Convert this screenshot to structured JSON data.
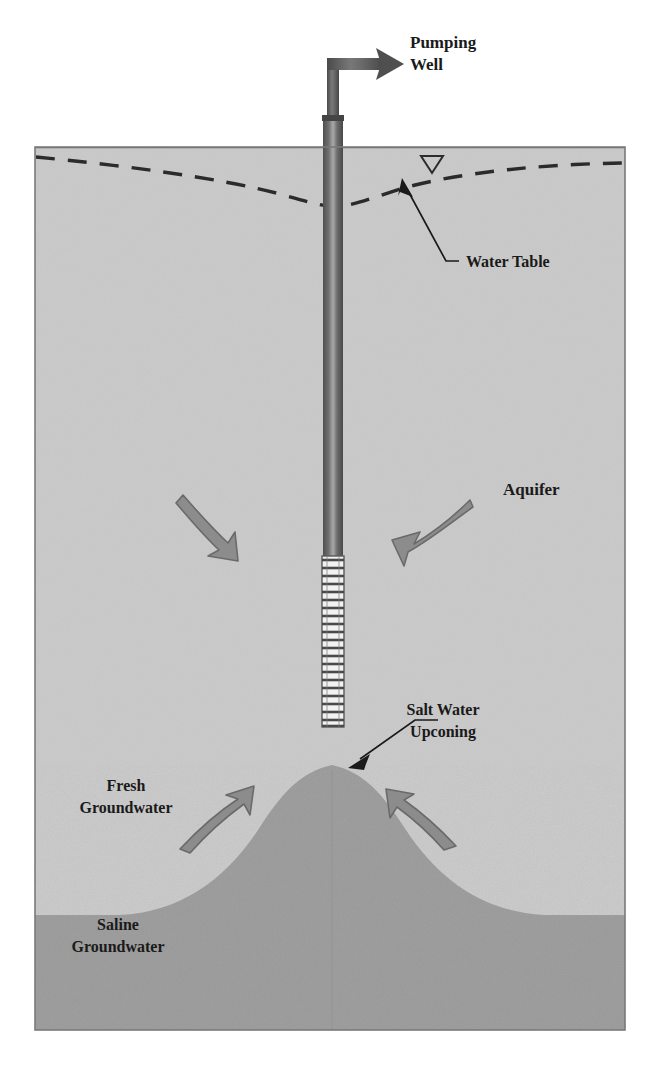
{
  "figure": {
    "type": "cross-section-diagram",
    "frame": {
      "x": 35,
      "y": 147,
      "width": 590,
      "height": 883
    }
  },
  "colors": {
    "background": "#ffffff",
    "aquifer_fill": "#c9c9c9",
    "saline_fill": "#9a9a9a",
    "upconing_fill": "#9a9a9a",
    "frame_stroke": "#6e6e6e",
    "ground_surface_stroke": "#6e6e6e",
    "water_table_stroke": "#2b2b2b",
    "casing_dark": "#5a5a5a",
    "casing_light": "#b9b9b9",
    "screen_fill": "#f2f2f2",
    "screen_slot": "#4a4a4a",
    "flow_arrow_fill": "#8c8c8c",
    "flow_arrow_stroke": "#6a6a6a",
    "leader_stroke": "#1a1a1a",
    "label_text": "#1a1a1a"
  },
  "labels": {
    "pumping_well": {
      "line1": "Pumping",
      "line2": "Well",
      "x": 410,
      "y": 48
    },
    "water_table": {
      "text": "Water Table",
      "x": 466,
      "y": 267
    },
    "aquifer": {
      "text": "Aquifer",
      "x": 503,
      "y": 495
    },
    "salt_water_upconing": {
      "line1": "Salt Water",
      "line2": "Upconing",
      "x": 420,
      "y": 715
    },
    "fresh_groundwater": {
      "line1": "Fresh",
      "line2": "Groundwater",
      "x": 82,
      "y": 791
    },
    "saline_groundwater": {
      "line1": "Saline",
      "line2": "Groundwater",
      "x": 74,
      "y": 930
    }
  },
  "well": {
    "casing_top_y": 115,
    "casing_bottom_y": 556,
    "casing_left_x": 323,
    "casing_width": 20,
    "riser_pipe_top_y": 58,
    "discharge_pipe_end_x": 400,
    "screen_top_y": 556,
    "screen_bottom_y": 727,
    "screen_slot_count": 22
  },
  "layers": {
    "ground_surface_y": 147,
    "saline_interface_y": 915,
    "bottom_y": 1030
  },
  "water_table": {
    "style": "dashed",
    "left_edge_y": 157,
    "right_edge_y": 163,
    "cone_of_depression_x": 335,
    "cone_of_depression_y": 207,
    "symbol": "water-table-triangle",
    "symbol_x": 432,
    "symbol_y": 166
  },
  "upconing": {
    "shape": "gaussian-mound",
    "peak_x": 332,
    "peak_y": 765,
    "base_y": 915,
    "half_width": 250
  },
  "flow_arrows": [
    {
      "name": "aquifer-flow-left",
      "direction": "down-right",
      "from_x": 186,
      "from_y": 497,
      "to_x": 232,
      "to_y": 551
    },
    {
      "name": "aquifer-flow-right",
      "direction": "down-left",
      "from_x": 465,
      "from_y": 501,
      "to_x": 408,
      "to_y": 549
    },
    {
      "name": "fresh-flow-left",
      "direction": "up-right",
      "from_x": 182,
      "from_y": 845,
      "to_x": 243,
      "to_y": 795
    },
    {
      "name": "fresh-flow-right",
      "direction": "up-left",
      "from_x": 452,
      "from_y": 842,
      "to_x": 404,
      "to_y": 793
    }
  ],
  "leaders": [
    {
      "name": "water-table-leader",
      "from_x": 459,
      "from_y": 261,
      "to_x": 406,
      "to_y": 184
    },
    {
      "name": "upconing-leader",
      "from_x": 413,
      "from_y": 721,
      "to_x": 352,
      "to_y": 762
    }
  ]
}
